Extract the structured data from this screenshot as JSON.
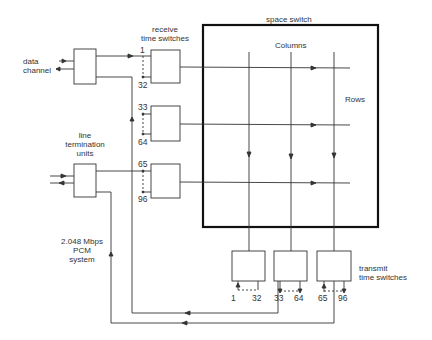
{
  "diagram": {
    "type": "time-space-time switch block diagram",
    "labels": {
      "space_switch": "space switch",
      "columns": "Columns",
      "rows": "Rows",
      "receive_time_switches": [
        "receive",
        "time switches"
      ],
      "transmit_time_switches": [
        "transmit",
        "time switches"
      ],
      "data_channel": [
        "data",
        "channel"
      ],
      "line_termination_units": [
        "line",
        "termination",
        "units"
      ],
      "pcm_system": [
        "2.048 Mbps",
        "PCM",
        "system"
      ]
    },
    "receive_channel_ranges": [
      {
        "start": "1",
        "end": "32"
      },
      {
        "start": "33",
        "end": "64"
      },
      {
        "start": "65",
        "end": "96"
      }
    ],
    "transmit_channel_ranges": [
      {
        "start": "1",
        "end": "32"
      },
      {
        "start": "33",
        "end": "64"
      },
      {
        "start": "65",
        "end": "96"
      }
    ],
    "line_color": "#333333",
    "border_color": "#111111"
  }
}
